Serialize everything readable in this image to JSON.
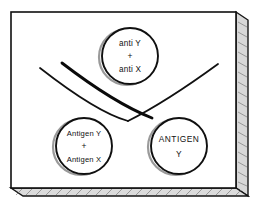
{
  "figure": {
    "plate": {
      "name": "agar-plate",
      "fill_color": "#ffffff",
      "border_color": "#101010",
      "edge_shadow_color": "#8f8f8f",
      "edge_hatch_color": "#6e6e6e"
    },
    "wells": [
      {
        "id": "antibody-well",
        "position": "top-center",
        "cx": 130,
        "cy": 56,
        "r": 28,
        "lines": [
          "anti Y",
          "+",
          "anti X"
        ]
      },
      {
        "id": "antigen-mixture-well",
        "position": "bottom-left",
        "cx": 84,
        "cy": 146,
        "r": 28,
        "lines": [
          "Antigen Y",
          "+",
          "Antigen X"
        ]
      },
      {
        "id": "antigen-y-well",
        "position": "bottom-right",
        "cx": 179,
        "cy": 146,
        "r": 28,
        "lines": [
          "ANTIGEN",
          "Y"
        ]
      }
    ],
    "precipitin_lines": [
      {
        "id": "outer-arc-left",
        "style": "thin-curve",
        "stroke_width": 1.6
      },
      {
        "id": "inner-arc-left",
        "style": "thick-curve",
        "stroke_width": 2.8
      },
      {
        "id": "arc-right",
        "style": "thin-curve",
        "stroke_width": 1.8
      }
    ]
  }
}
